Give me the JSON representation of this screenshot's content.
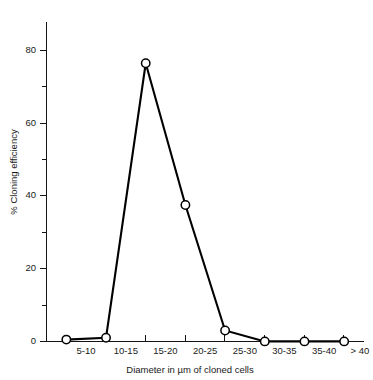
{
  "figure": {
    "background_color": "#ffffff",
    "line_color": "#000000",
    "marker_fill": "#ffffff",
    "axis_color": "#141414"
  },
  "chart_data": {
    "type": "line",
    "title": "",
    "subtitle": "",
    "xlabel": "Diameter in µm of cloned cells",
    "ylabel": "% Cloning efficiency",
    "categories": [
      "5-10",
      "10-15",
      "15-20",
      "20-25",
      "25-30",
      "30-35",
      "35-40",
      "> 40"
    ],
    "values": [
      0.5,
      1.0,
      76.5,
      37.5,
      3.0,
      0.0,
      0.0,
      0.0
    ],
    "series": [
      {
        "name": "Cloning efficiency",
        "values": [
          0.5,
          1.0,
          76.5,
          37.5,
          3.0,
          0.0,
          0.0,
          0.0
        ],
        "marker": "open-circle",
        "color": "#000000"
      }
    ],
    "ylim": [
      0,
      88
    ],
    "xlim_categories": 8,
    "y_major_ticks": [
      0,
      20,
      40,
      60,
      80
    ],
    "y_minor_ticks": [
      10,
      30,
      50,
      70
    ],
    "y_tick_labels": [
      "0",
      "20",
      "40",
      "60",
      "80"
    ],
    "grid": false,
    "legend": false,
    "legend_position": "none",
    "frame": "left-bottom-only"
  },
  "axes": {
    "y_labels": [
      "80",
      "60",
      "40",
      "20",
      "0"
    ],
    "x_labels": [
      "5-10",
      "10-15",
      "15-20",
      "20-25",
      "25-30",
      "30-35",
      "35-40",
      "> 40"
    ],
    "y_title": "% Cloning efficiency",
    "x_title": "Diameter in µm of cloned cells"
  }
}
